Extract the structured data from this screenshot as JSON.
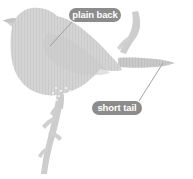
{
  "figure": {
    "background_color": "#ffffff",
    "bird_fill_color": "#d2d2d2",
    "bird_shade_color": "#c6c6c6",
    "branch_color": "#cfcfcf",
    "leader_line_color": "#9a9a9a",
    "callout_background_color": "#8c8c8c",
    "callout_text_color": "#ffffff"
  },
  "callouts": [
    {
      "id": "plain-back",
      "label": "plain back",
      "badge": {
        "x": 69,
        "y": 8,
        "width": 52,
        "height": 14
      },
      "leader": {
        "from_x": 72,
        "from_y": 22,
        "to_x": 50,
        "to_y": 46
      }
    },
    {
      "id": "short-tail",
      "label": "short tail",
      "badge": {
        "x": 92,
        "y": 101,
        "width": 50,
        "height": 14
      },
      "leader": {
        "from_x": 139,
        "from_y": 101,
        "to_x": 163,
        "to_y": 63
      }
    }
  ]
}
